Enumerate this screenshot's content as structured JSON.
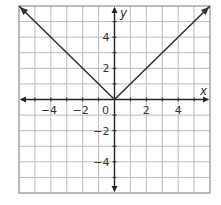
{
  "chart_data": {
    "type": "line",
    "title": "",
    "xlabel": "x",
    "ylabel": "y",
    "xlim": [
      -6,
      6
    ],
    "ylim": [
      -6,
      6
    ],
    "grid": true,
    "x_ticks": [
      -4,
      -2,
      0,
      2,
      4
    ],
    "y_ticks": [
      4,
      2,
      -2,
      -4
    ],
    "x_tick_labels": [
      "−4",
      "−2",
      "0",
      "2",
      "4"
    ],
    "y_tick_labels": [
      "4",
      "2",
      "−2",
      "−4"
    ],
    "origin_label": "0",
    "series": [
      {
        "name": "y = |x|",
        "x": [
          -6,
          0,
          6
        ],
        "y": [
          6,
          0,
          6
        ],
        "arrows": "both-ends",
        "color": "#333333"
      }
    ]
  }
}
